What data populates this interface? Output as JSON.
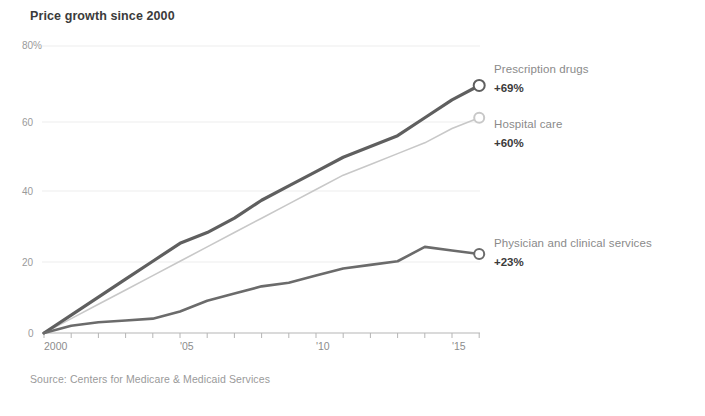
{
  "chart_title": "Price growth since 2000",
  "source": "Source: Centers for Medicare & Medicaid Services",
  "legend": [
    {
      "name": "Prescription drugs",
      "value": "+69%",
      "number": "+69",
      "pct": "%"
    },
    {
      "name": "Hospital care",
      "value": "+60%",
      "number": "+60",
      "pct": "%"
    },
    {
      "name": "Physician and clinical services",
      "value": "+23%",
      "number": "+23",
      "pct": "%"
    }
  ],
  "axis": {
    "y_ticks": [
      "80%",
      "60",
      "40",
      "20",
      "0"
    ],
    "y_tick_0": "80%",
    "y_tick_1": "60",
    "y_tick_2": "40",
    "y_tick_3": "20",
    "y_tick_4": "0",
    "x_ticks": [
      "2000",
      "'05",
      "'10",
      "'15"
    ],
    "x_tick_0": "2000",
    "x_tick_1": "'05",
    "x_tick_2": "'10",
    "x_tick_3": "'15"
  },
  "colors": {
    "prescription": "#5f5f5f",
    "hospital": "#c8c8c8",
    "physician": "#6b6b6b",
    "grid": "#ededed",
    "axis": "#b5b5b5",
    "title": "#3b3b3b",
    "label": "#8a8a8a"
  },
  "chart_data": {
    "type": "line",
    "title": "Price growth since 2000",
    "xlabel": "",
    "ylabel": "",
    "xlim": [
      2000,
      2016
    ],
    "ylim": [
      0,
      80
    ],
    "grid": true,
    "legend_position": "right-inline",
    "annotations": [
      "Source: Centers for Medicare & Medicaid Services"
    ],
    "x": [
      2000,
      2001,
      2002,
      2003,
      2004,
      2005,
      2006,
      2007,
      2008,
      2009,
      2010,
      2011,
      2012,
      2013,
      2014,
      2015,
      2016
    ],
    "series": [
      {
        "name": "Prescription drugs",
        "color": "#5f5f5f",
        "end_label": "+69%",
        "values": [
          0,
          5,
          10,
          15,
          20,
          25,
          28,
          32,
          37,
          41,
          45,
          49,
          52,
          55,
          60,
          65,
          69
        ]
      },
      {
        "name": "Hospital care",
        "color": "#c8c8c8",
        "end_label": "+60%",
        "values": [
          0,
          4,
          8,
          12,
          16,
          20,
          24,
          28,
          32,
          36,
          40,
          44,
          47,
          50,
          53,
          57,
          60
        ]
      },
      {
        "name": "Physician and clinical services",
        "color": "#6b6b6b",
        "end_label": "+23%",
        "values": [
          0,
          2,
          3,
          3.5,
          4,
          6,
          9,
          11,
          13,
          14,
          16,
          18,
          19,
          20,
          24,
          23,
          22
        ]
      }
    ]
  }
}
